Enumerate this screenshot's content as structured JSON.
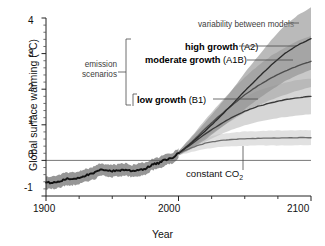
{
  "chart_data": {
    "type": "line",
    "title": "",
    "xlabel": "Year",
    "ylabel": "Global surface warming (°C)",
    "xlim": [
      1900,
      2100
    ],
    "ylim": [
      -1,
      4
    ],
    "xticks": [
      1900,
      2000,
      2100
    ],
    "xticklabels": [
      "1900",
      "2000",
      "2100"
    ],
    "xminortick_step": 25,
    "yticks": [
      -1,
      0,
      1,
      2,
      3,
      4
    ],
    "yticklabels": [
      "-1",
      "0",
      "1",
      "2",
      "3",
      "4"
    ],
    "yminortick_step": 0.2,
    "grid": false,
    "zero_line": true,
    "legend_position": "inline-annotations",
    "series": [
      {
        "name": "historical observations",
        "color": "#111111",
        "band_color": "#909090",
        "x": [
          1900,
          1905,
          1910,
          1915,
          1920,
          1925,
          1930,
          1935,
          1940,
          1945,
          1950,
          1955,
          1960,
          1965,
          1970,
          1975,
          1980,
          1985,
          1990,
          1995,
          2000
        ],
        "values": [
          -0.62,
          -0.63,
          -0.6,
          -0.52,
          -0.52,
          -0.48,
          -0.42,
          -0.38,
          -0.28,
          -0.26,
          -0.3,
          -0.28,
          -0.26,
          -0.3,
          -0.26,
          -0.24,
          -0.12,
          -0.08,
          0.02,
          0.06,
          0.2
        ],
        "band_lower": [
          -0.8,
          -0.8,
          -0.78,
          -0.7,
          -0.7,
          -0.66,
          -0.6,
          -0.56,
          -0.45,
          -0.43,
          -0.47,
          -0.45,
          -0.43,
          -0.47,
          -0.43,
          -0.41,
          -0.28,
          -0.24,
          -0.13,
          -0.09,
          0.06
        ],
        "band_upper": [
          -0.44,
          -0.46,
          -0.42,
          -0.34,
          -0.34,
          -0.3,
          -0.24,
          -0.2,
          -0.11,
          -0.09,
          -0.13,
          -0.11,
          -0.09,
          -0.13,
          -0.09,
          -0.07,
          0.04,
          0.08,
          0.17,
          0.21,
          0.34
        ]
      },
      {
        "name": "high growth (A2)",
        "color": "#2b2b2b",
        "band_color": "#8f8f8f",
        "x": [
          2000,
          2010,
          2020,
          2030,
          2040,
          2050,
          2060,
          2070,
          2080,
          2090,
          2100
        ],
        "values": [
          0.2,
          0.5,
          0.82,
          1.18,
          1.55,
          1.95,
          2.32,
          2.68,
          3.0,
          3.24,
          3.42
        ],
        "band_lower": [
          0.14,
          0.34,
          0.58,
          0.86,
          1.14,
          1.44,
          1.72,
          1.98,
          2.22,
          2.4,
          2.54
        ],
        "band_upper": [
          0.26,
          0.66,
          1.06,
          1.5,
          1.96,
          2.46,
          2.92,
          3.38,
          3.78,
          4.08,
          4.3
        ]
      },
      {
        "name": "moderate growth (A1B)",
        "color": "#4d4d4d",
        "band_color": "#a8a8a8",
        "x": [
          2000,
          2010,
          2020,
          2030,
          2040,
          2050,
          2060,
          2070,
          2080,
          2090,
          2100
        ],
        "values": [
          0.2,
          0.52,
          0.88,
          1.22,
          1.54,
          1.84,
          2.1,
          2.32,
          2.5,
          2.66,
          2.78
        ],
        "band_lower": [
          0.14,
          0.36,
          0.62,
          0.88,
          1.12,
          1.34,
          1.54,
          1.7,
          1.84,
          1.96,
          2.06
        ],
        "band_upper": [
          0.26,
          0.68,
          1.14,
          1.56,
          1.96,
          2.34,
          2.66,
          2.94,
          3.16,
          3.36,
          3.5
        ]
      },
      {
        "name": "low growth (B1)",
        "color": "#3a3a3a",
        "band_color": "#bdbdbd",
        "x": [
          2000,
          2010,
          2020,
          2030,
          2040,
          2050,
          2060,
          2070,
          2080,
          2090,
          2100
        ],
        "values": [
          0.2,
          0.46,
          0.74,
          0.98,
          1.2,
          1.38,
          1.52,
          1.62,
          1.7,
          1.76,
          1.8
        ],
        "band_lower": [
          0.14,
          0.32,
          0.52,
          0.7,
          0.86,
          0.98,
          1.08,
          1.16,
          1.22,
          1.26,
          1.3
        ],
        "band_upper": [
          0.26,
          0.6,
          0.96,
          1.26,
          1.54,
          1.78,
          1.96,
          2.08,
          2.18,
          2.26,
          2.3
        ]
      },
      {
        "name": "constant CO2",
        "color": "#6e6e6e",
        "band_color": "#cfcfcf",
        "x": [
          2000,
          2010,
          2020,
          2030,
          2040,
          2050,
          2060,
          2070,
          2080,
          2090,
          2100
        ],
        "values": [
          0.2,
          0.36,
          0.48,
          0.55,
          0.59,
          0.61,
          0.62,
          0.63,
          0.63,
          0.64,
          0.64
        ],
        "band_lower": [
          0.14,
          0.24,
          0.32,
          0.37,
          0.4,
          0.41,
          0.42,
          0.42,
          0.42,
          0.43,
          0.43
        ],
        "band_upper": [
          0.26,
          0.48,
          0.64,
          0.73,
          0.78,
          0.81,
          0.82,
          0.84,
          0.84,
          0.85,
          0.85
        ]
      }
    ],
    "annotations": [
      {
        "name": "variability-between-models",
        "text": "variability between models"
      },
      {
        "name": "emission-scenarios",
        "line1": "emission",
        "line2": "scenarios"
      },
      {
        "name": "constant-co2",
        "text_before": "constant CO",
        "text_sub": "2"
      }
    ]
  },
  "axes": {
    "y_title": "Global surface warming (°C)",
    "x_title": "Year",
    "y_ticks": [
      "4",
      "3",
      "2",
      "1",
      "0",
      "-1"
    ],
    "x_ticks": [
      "1900",
      "2000",
      "2100"
    ]
  },
  "labels": {
    "variability": "variability between models",
    "emission_line1": "emission",
    "emission_line2": "scenarios",
    "high_growth": "high growth",
    "high_growth_code": "(A2)",
    "moderate_growth": "moderate growth",
    "moderate_growth_code": "(A1B)",
    "low_growth": "low growth",
    "low_growth_code": "(B1)",
    "constant_co2": "constant CO",
    "constant_co2_sub": "2"
  }
}
